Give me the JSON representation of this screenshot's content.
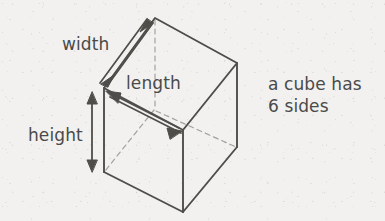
{
  "diagram": {
    "type": "3d-cube-labelled",
    "background_color": "#f2f1ef",
    "stroke_color": "#4a4a4a",
    "hidden_edge_color": "#9a9894",
    "text_color": "#4a4a4a",
    "labels": {
      "width": "width",
      "length": "length",
      "height": "height"
    },
    "note": {
      "line1": "a cube has",
      "line2": "6 sides"
    },
    "dimension_arrows": [
      {
        "name": "width-arrow",
        "label": "width",
        "style": "double-headed-elongated",
        "direction": "diagonal-up-right"
      },
      {
        "name": "length-arrow",
        "label": "length",
        "style": "double-headed-elongated",
        "direction": "diagonal-down-right"
      },
      {
        "name": "height-arrow",
        "label": "height",
        "style": "double-headed-line",
        "direction": "vertical"
      }
    ],
    "vertices": {
      "top_back": [
        155,
        18
      ],
      "top_right": [
        237,
        63
      ],
      "top_left": [
        104,
        88
      ],
      "front_center": [
        183,
        130
      ],
      "bottom_left": [
        104,
        172
      ],
      "bottom_front": [
        183,
        212
      ],
      "bottom_right": [
        237,
        147
      ],
      "hidden_back": [
        155,
        110
      ]
    },
    "hidden_edges": [
      {
        "from": "top_back",
        "to": "hidden_back"
      },
      {
        "from": "hidden_back",
        "to": "bottom_left"
      },
      {
        "from": "hidden_back",
        "to": "bottom_right"
      }
    ],
    "visible_faces": [
      "top",
      "left-front",
      "right-front"
    ],
    "side_count": 6
  }
}
